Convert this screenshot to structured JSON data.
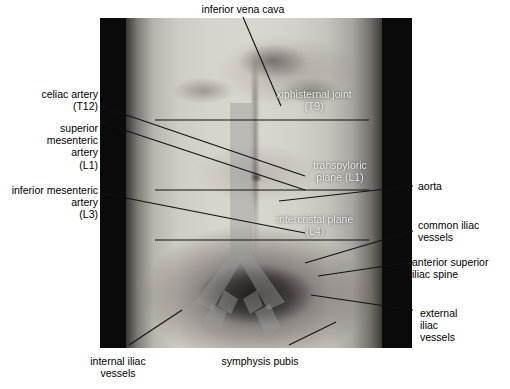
{
  "figure": {
    "photo_alt": "Anterior view of a male torso from lower chest to pubis"
  },
  "colors": {
    "background": "#ffffff",
    "leader_line": "#111111",
    "overlay_vessel": "#9a9a96",
    "photo_border": "#0a0a0a",
    "on_photo_text": "#f2f2f0"
  },
  "labels": {
    "top": [
      {
        "id": "inferior-vena-cava",
        "text": "inferior vena cava",
        "align": "center"
      }
    ],
    "left": [
      {
        "id": "celiac-artery",
        "text": "celiac artery\n(T12)",
        "align": "right"
      },
      {
        "id": "superior-mesenteric-artery",
        "text": "superior\nmesenteric\nartery\n(L1)",
        "align": "right"
      },
      {
        "id": "inferior-mesenteric-artery",
        "text": "inferior mesenteric\nartery\n(L3)",
        "align": "right"
      }
    ],
    "right": [
      {
        "id": "aorta",
        "text": "aorta",
        "align": "left"
      },
      {
        "id": "common-iliac-vessels",
        "text": "common iliac\nvessels",
        "align": "left"
      },
      {
        "id": "anterior-superior-iliac-spine",
        "text": "anterior superior\niliac spine",
        "align": "left"
      },
      {
        "id": "external-iliac-vessels",
        "text": "external\niliac\nvessels",
        "align": "left"
      }
    ],
    "bottom": [
      {
        "id": "internal-iliac-vessels",
        "text": "internal iliac\nvessels",
        "align": "center"
      },
      {
        "id": "symphysis-pubis",
        "text": "symphysis pubis",
        "align": "center"
      }
    ],
    "on_photo": [
      {
        "id": "xiphisternal-joint",
        "text": "xiphisternal joint\n(T9)",
        "align": "center"
      },
      {
        "id": "transpyloric-plane",
        "text": "transpyloric\nplane (L1)",
        "align": "center"
      },
      {
        "id": "intercristal-plane",
        "text": "intercristal plane\n(L4)",
        "align": "center"
      }
    ]
  }
}
